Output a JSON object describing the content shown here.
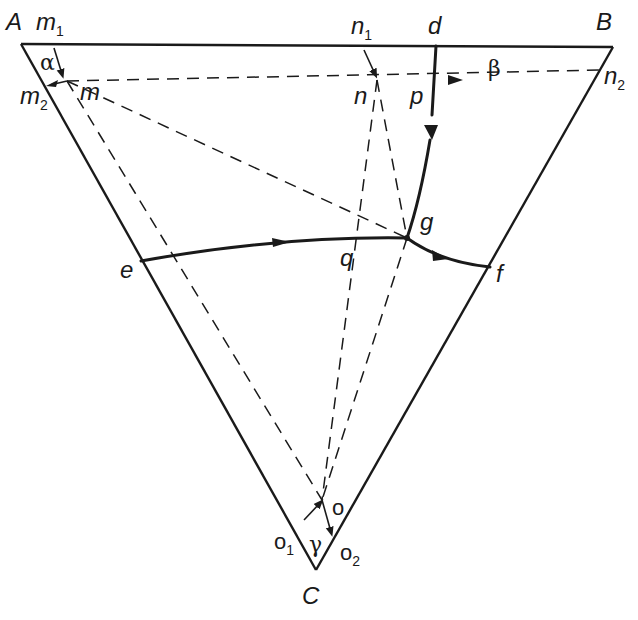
{
  "diagram": {
    "type": "ternary-phase-diagram",
    "vertices": {
      "A": {
        "label": "A",
        "x": 21,
        "y": 44
      },
      "B": {
        "label": "B",
        "x": 613,
        "y": 47
      },
      "C": {
        "label": "C",
        "x": 316,
        "y": 570
      }
    },
    "points": {
      "m1": {
        "label": "m",
        "sub": "1"
      },
      "m2": {
        "label": "m",
        "sub": "2"
      },
      "m": {
        "label": "m"
      },
      "n1": {
        "label": "n",
        "sub": "1"
      },
      "n": {
        "label": "n"
      },
      "n2": {
        "label": "n",
        "sub": "2"
      },
      "d": {
        "label": "d"
      },
      "p": {
        "label": "p"
      },
      "g": {
        "label": "g"
      },
      "e": {
        "label": "e"
      },
      "f": {
        "label": "f"
      },
      "q": {
        "label": "q"
      },
      "o": {
        "label": "o"
      },
      "o1": {
        "label": "o",
        "sub": "1"
      },
      "o2": {
        "label": "o",
        "sub": "2"
      }
    },
    "angles": {
      "alpha": "α",
      "beta": "β",
      "gamma": "γ"
    },
    "boundary_curves": [
      {
        "name": "d-g",
        "from": "d",
        "to": "g"
      },
      {
        "name": "e-g",
        "from": "e",
        "to": "g"
      },
      {
        "name": "g-f",
        "from": "g",
        "to": "f"
      }
    ],
    "eutectic_point": "g"
  }
}
